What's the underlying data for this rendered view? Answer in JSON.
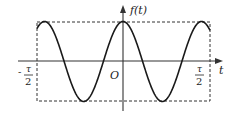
{
  "diagram": {
    "type": "function-plot",
    "y_axis_label": "f(t)",
    "x_axis_label": "t",
    "origin_label": "O",
    "left_bound": {
      "sign": "-",
      "numerator": "τ",
      "denominator": "2"
    },
    "right_bound": {
      "numerator": "τ",
      "denominator": "2"
    },
    "curve": {
      "description": "cosine-like periodic waveform, maximum at t=0, truncated to window [-τ/2, τ/2]",
      "peaks_visible": 3,
      "troughs_visible": 2
    },
    "window_box": {
      "style": "dashed",
      "x_range": [
        "-τ/2",
        "τ/2"
      ],
      "y_range": [
        "min",
        "max"
      ]
    },
    "colors": {
      "curve": "#1a1a1a",
      "axes": "#333333",
      "box": "#333333"
    }
  }
}
